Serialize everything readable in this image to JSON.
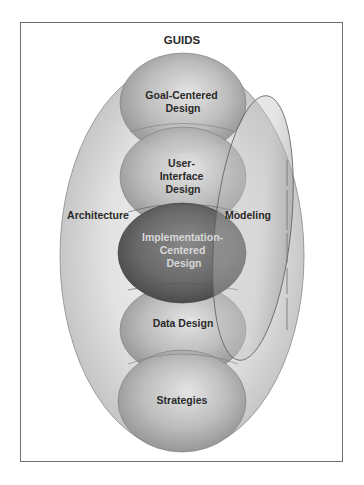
{
  "diagram": {
    "title": "GUIDS",
    "outer": {
      "name": "GUIDS",
      "left_label": "Architecture",
      "right_label": "Modeling"
    },
    "nodes": [
      {
        "id": "goal",
        "line1": "Goal-Centered",
        "line2": "Design",
        "line3": ""
      },
      {
        "id": "ui",
        "line1": "User-",
        "line2": "Interface",
        "line3": "Design"
      },
      {
        "id": "impl",
        "line1": "Implementation-",
        "line2": "Centered",
        "line3": "Design"
      },
      {
        "id": "data",
        "line1": "Data Design",
        "line2": "",
        "line3": ""
      },
      {
        "id": "strategies",
        "line1": "Strategies",
        "line2": "",
        "line3": ""
      }
    ],
    "overlay": {
      "name": "Modeling",
      "style": "tilted translucent ellipse spanning Goal-Centered through Data Design"
    },
    "colors": {
      "frame": "#6e6e6e",
      "outer_fill": "#d4d4d4",
      "node_fill": "#a9a9a9",
      "impl_fill": "#6a6a6a",
      "text": "#2a2a2a",
      "impl_text": "#d8d8d8"
    }
  }
}
